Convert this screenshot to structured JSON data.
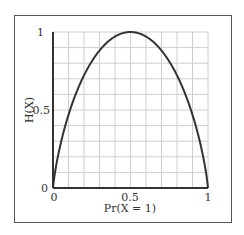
{
  "chart_data": {
    "type": "line",
    "title": "",
    "xlabel": "Pr(X = 1)",
    "ylabel": "H(X)",
    "xlim": [
      0,
      1
    ],
    "ylim": [
      0,
      1
    ],
    "grid": true,
    "x_ticks": [
      "0",
      "0.5",
      "1"
    ],
    "y_ticks": [
      "0",
      "0.5",
      "1"
    ],
    "series": [
      {
        "name": "binary entropy",
        "x": [
          0,
          0.05,
          0.1,
          0.15,
          0.2,
          0.25,
          0.3,
          0.35,
          0.4,
          0.45,
          0.5,
          0.55,
          0.6,
          0.65,
          0.7,
          0.75,
          0.8,
          0.85,
          0.9,
          0.95,
          1
        ],
        "values": [
          0,
          0.286,
          0.469,
          0.61,
          0.722,
          0.811,
          0.881,
          0.934,
          0.971,
          0.993,
          1,
          0.993,
          0.971,
          0.934,
          0.881,
          0.811,
          0.722,
          0.61,
          0.469,
          0.286,
          0
        ]
      }
    ],
    "legend": null
  },
  "axes": {
    "x_tick_0": "0",
    "x_tick_mid": "0.5",
    "x_tick_1": "1",
    "y_tick_0": "0",
    "y_tick_mid": "0.5",
    "y_tick_1": "1",
    "xlabel": "Pr(X = 1)",
    "ylabel": "H(X)"
  }
}
